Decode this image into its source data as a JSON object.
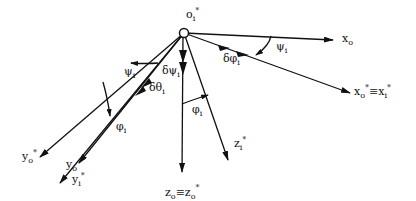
{
  "diagram": {
    "origin": {
      "label": "o",
      "sub": "i",
      "sup": "*",
      "x": 184,
      "y": 33
    },
    "axes": [
      {
        "id": "x_o",
        "label": "x",
        "sub": "o",
        "sup": "",
        "end": [
          333,
          40
        ],
        "label_pos": [
          342,
          42
        ]
      },
      {
        "id": "x_o_star_equiv_x_i_star",
        "label": "x",
        "sub": "o",
        "sup": "*",
        "extra": "≡x",
        "extra_sub": "i",
        "extra_sup": "*",
        "end": [
          350,
          93
        ],
        "label_pos": [
          354,
          92
        ]
      },
      {
        "id": "y_o_star",
        "label": "y",
        "sub": "o",
        "sup": "*",
        "end": [
          40,
          157
        ],
        "label_pos": [
          22,
          160
        ]
      },
      {
        "id": "y_o",
        "label": "y",
        "sub": "o",
        "sup": "",
        "end": [
          79,
          163
        ],
        "label_pos": [
          66,
          168
        ]
      },
      {
        "id": "y_i_star",
        "label": "y",
        "sub": "i",
        "sup": "*",
        "end": [
          60,
          183
        ],
        "label_pos": [
          72,
          183
        ]
      },
      {
        "id": "z_o_equiv_z_o_star",
        "label": "z",
        "sub": "o",
        "sup": "",
        "extra": "≡z",
        "extra_sub": "o",
        "extra_sup": "*",
        "end": [
          182,
          172
        ],
        "label_pos": [
          165,
          198
        ]
      },
      {
        "id": "z_i_star",
        "label": "z",
        "sub": "i",
        "sup": "*",
        "end": [
          228,
          160
        ],
        "label_pos": [
          235,
          157
        ]
      }
    ],
    "angle_labels": [
      {
        "id": "psi_i_right",
        "text": "ψ",
        "sub": "i",
        "pos": [
          277,
          52
        ]
      },
      {
        "id": "delta_phi_i",
        "text": "δφ",
        "sub": "i",
        "pos": [
          225,
          62
        ]
      },
      {
        "id": "psi_i_left",
        "text": "ψ",
        "sub": "i",
        "pos": [
          124,
          75
        ]
      },
      {
        "id": "delta_psi_i",
        "text": "δψ",
        "sub": "i",
        "pos": [
          162,
          77
        ]
      },
      {
        "id": "delta_theta_i",
        "text": "δθ",
        "sub": "i",
        "pos": [
          149,
          91
        ]
      },
      {
        "id": "phi_i_left",
        "text": "φ",
        "sub": "i",
        "pos": [
          116,
          130
        ]
      },
      {
        "id": "phi_i_right",
        "text": "φ",
        "sub": "i",
        "pos": [
          192,
          112
        ]
      }
    ]
  }
}
